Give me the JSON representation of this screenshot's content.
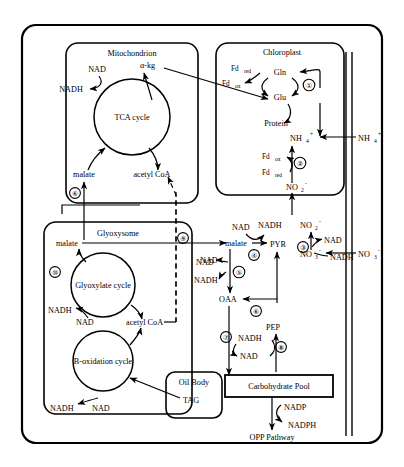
{
  "diagram": {
    "compartments": {
      "cell": "",
      "mitochondrion": "Mitochondrion",
      "chloroplast": "Chloroplast",
      "glyoxysome": "Glyoxysome",
      "oil_body": "Oil Body",
      "carbohydrate_pool": "Carbohydrate Pool"
    },
    "cycles": {
      "tca": "TCA cycle",
      "glyoxylate": "Glyoxylate cycle",
      "beta_oxidation": "B-oxidation cycle"
    },
    "mitochondrion_labels": {
      "nad": "NAD",
      "nadh": "NADH",
      "akg": "α-kg",
      "malate": "malate",
      "acetyl_coa": "acetyl CoA",
      "step": "⑥"
    },
    "chloroplast_labels": {
      "fd_red_top": "Fd",
      "fd_red_top_sub": "red",
      "fd_ox_top": "Fd",
      "fd_ox_top_sub": "ox",
      "gln": "Gln",
      "glu": "Glu",
      "protein": "Protein",
      "step1": "①",
      "fd_ox_bot": "Fd",
      "fd_ox_bot_sub": "ox",
      "fd_red_bot": "Fd",
      "fd_red_bot_sub": "red",
      "step2": "②",
      "nh4_in": "NH",
      "nh4_in_sub": "4",
      "nh4_in_sup": "+",
      "no2_in": "NO",
      "no2_in_sub": "2",
      "no2_in_sup": "-"
    },
    "external_labels": {
      "nh4_out": "NH",
      "nh4_out_sub": "4",
      "nh4_out_sup": "+",
      "no3_out": "NO",
      "no3_out_sub": "3",
      "no3_out_sup": "-"
    },
    "cytosol_labels": {
      "nad_top": "NAD",
      "nadh_top": "NADH",
      "malate": "malate",
      "pyr": "PYR",
      "step4": "④",
      "nad_left": "NAD",
      "nadh_left": "NADH",
      "step5": "⑤",
      "oaa": "OAA",
      "step6": "⑥",
      "pep": "PEP",
      "step7": "⑦",
      "nadh_bot": "NADH",
      "nad_bot": "NAD",
      "step8": "⑧",
      "step9": "⑨",
      "no2_cyt": "NO",
      "no2_cyt_sub": "2",
      "no2_cyt_sup": "-",
      "nad_n": "NAD",
      "nadh_n": "NADH",
      "step3": "③",
      "no3_cyt": "NO",
      "no3_cyt_sub": "3",
      "no3_cyt_sup": "-"
    },
    "glyoxysome_labels": {
      "malate": "malate",
      "step10": "⑩",
      "nadh_gx": "NADH",
      "nad_gx": "NAD",
      "acetyl_coa": "acetyl CoA",
      "nadh_bo": "NADH",
      "nad_bo": "NAD"
    },
    "pool_labels": {
      "tag": "TAG",
      "nadp": "NADP",
      "nadph": "NADPH",
      "opp": "OPP Pathway"
    }
  }
}
